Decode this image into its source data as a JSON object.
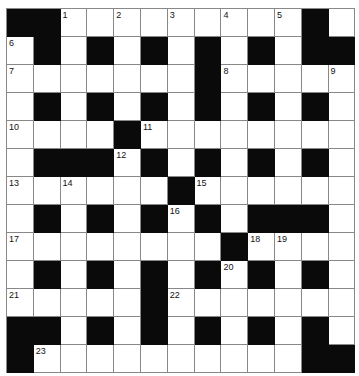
{
  "puzzle": {
    "rows": 13,
    "cols": 13,
    "colors": {
      "block": "#0a0a0a",
      "empty": "#ffffff",
      "gridline": "#888888"
    },
    "layout": [
      "##.........#.",
      ".#.#.#.#.#.##",
      ".......#.....",
      ".#.#.#.#.#.#.",
      "....#........",
      ".###.#.#.#.#.",
      "......#......",
      ".#.#.#.#.###.",
      "........#....",
      ".#.#.#.#.#.#.",
      ".....#.......",
      "##.#.#.#.#.#.",
      "#..........##"
    ],
    "numbers": [
      {
        "r": 0,
        "c": 2,
        "n": "1"
      },
      {
        "r": 0,
        "c": 4,
        "n": "2"
      },
      {
        "r": 0,
        "c": 6,
        "n": "3"
      },
      {
        "r": 0,
        "c": 8,
        "n": "4"
      },
      {
        "r": 0,
        "c": 10,
        "n": "5"
      },
      {
        "r": 1,
        "c": 0,
        "n": "6"
      },
      {
        "r": 2,
        "c": 0,
        "n": "7"
      },
      {
        "r": 2,
        "c": 8,
        "n": "8"
      },
      {
        "r": 2,
        "c": 12,
        "n": "9"
      },
      {
        "r": 4,
        "c": 0,
        "n": "10"
      },
      {
        "r": 4,
        "c": 5,
        "n": "11"
      },
      {
        "r": 5,
        "c": 4,
        "n": "12"
      },
      {
        "r": 6,
        "c": 0,
        "n": "13"
      },
      {
        "r": 6,
        "c": 2,
        "n": "14"
      },
      {
        "r": 6,
        "c": 7,
        "n": "15"
      },
      {
        "r": 7,
        "c": 6,
        "n": "16"
      },
      {
        "r": 8,
        "c": 0,
        "n": "17"
      },
      {
        "r": 8,
        "c": 9,
        "n": "18"
      },
      {
        "r": 8,
        "c": 10,
        "n": "19"
      },
      {
        "r": 9,
        "c": 8,
        "n": "20"
      },
      {
        "r": 10,
        "c": 0,
        "n": "21"
      },
      {
        "r": 10,
        "c": 6,
        "n": "22"
      },
      {
        "r": 12,
        "c": 1,
        "n": "23"
      }
    ]
  }
}
